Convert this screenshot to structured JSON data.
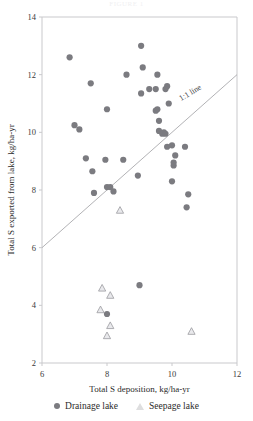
{
  "figure": {
    "partial_top_text": "FIGURE 1",
    "y_axis_title": "Total  S  exported from lake,  kg/ha-yr",
    "x_axis_title": "Total S deposition, kg/ha-yr",
    "annotation_label": "1:1 line",
    "colors": {
      "drainage": "#7b7b80",
      "seepage_fill": "#e9e9ec",
      "seepage_stroke": "#9a9a9f",
      "axis": "#c9c9cc",
      "refline": "#a9a9ad"
    }
  },
  "legend": {
    "position": "below-axis",
    "items": [
      {
        "label": "Drainage lake",
        "marker": "filled-circle"
      },
      {
        "label": "Seepage lake",
        "marker": "open-triangle"
      }
    ]
  },
  "chart_data": {
    "type": "scatter",
    "title": "",
    "xlabel": "Total S deposition, kg/ha-yr",
    "ylabel": "Total  S  exported from lake,  kg/ha-yr",
    "xlim": [
      6,
      12
    ],
    "ylim": [
      2,
      14
    ],
    "xticks": [
      6,
      8,
      10,
      12
    ],
    "yticks": [
      2,
      4,
      6,
      8,
      10,
      12,
      14
    ],
    "grid": false,
    "legend_position": "bottom",
    "annotations": [
      {
        "text": "1:1 line",
        "x": 10.6,
        "y": 11.3,
        "rotation": -31
      }
    ],
    "reference_lines": [
      {
        "name": "1:1 line",
        "type": "identity",
        "from": [
          6,
          6
        ],
        "to": [
          12,
          12
        ]
      }
    ],
    "series": [
      {
        "name": "Drainage lake",
        "marker": "filled-circle",
        "color": "#7b7b80",
        "points": [
          [
            6.85,
            12.6
          ],
          [
            7.0,
            10.25
          ],
          [
            7.15,
            10.1
          ],
          [
            7.5,
            11.7
          ],
          [
            7.35,
            9.1
          ],
          [
            7.55,
            8.65
          ],
          [
            7.6,
            7.9
          ],
          [
            8.0,
            10.8
          ],
          [
            7.95,
            9.05
          ],
          [
            8.0,
            8.1
          ],
          [
            8.1,
            8.1
          ],
          [
            8.2,
            7.95
          ],
          [
            8.6,
            12.0
          ],
          [
            8.5,
            9.05
          ],
          [
            8.95,
            8.5
          ],
          [
            9.0,
            4.7
          ],
          [
            9.1,
            12.25
          ],
          [
            9.05,
            13.0
          ],
          [
            9.05,
            11.35
          ],
          [
            9.3,
            11.5
          ],
          [
            9.5,
            11.5
          ],
          [
            9.55,
            10.8
          ],
          [
            9.5,
            10.75
          ],
          [
            9.6,
            10.4
          ],
          [
            9.6,
            10.05
          ],
          [
            9.7,
            9.95
          ],
          [
            9.75,
            10.0
          ],
          [
            9.8,
            9.95
          ],
          [
            9.55,
            12.0
          ],
          [
            9.85,
            11.6
          ],
          [
            9.8,
            11.5
          ],
          [
            9.9,
            11.0
          ],
          [
            10.0,
            9.55
          ],
          [
            9.85,
            9.5
          ],
          [
            10.05,
            8.85
          ],
          [
            10.1,
            9.2
          ],
          [
            10.0,
            8.3
          ],
          [
            10.05,
            8.95
          ],
          [
            10.4,
            9.5
          ],
          [
            10.5,
            7.85
          ],
          [
            10.45,
            7.4
          ],
          [
            8.0,
            3.7
          ]
        ]
      },
      {
        "name": "Seepage lake",
        "marker": "open-triangle",
        "color": "#e9e9ec",
        "points": [
          [
            8.4,
            7.3
          ],
          [
            7.85,
            4.6
          ],
          [
            8.1,
            4.35
          ],
          [
            7.8,
            3.85
          ],
          [
            8.1,
            3.3
          ],
          [
            8.0,
            2.95
          ],
          [
            10.6,
            3.1
          ]
        ]
      }
    ]
  }
}
